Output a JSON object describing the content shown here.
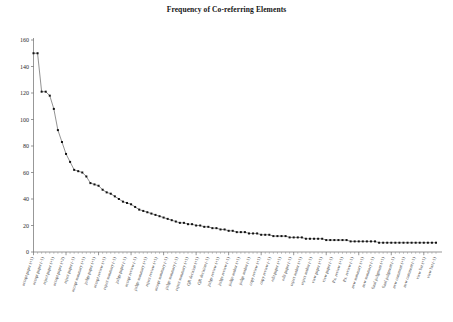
{
  "figure": {
    "title": "Frequency of Co-referring Elements",
    "background_color": "#ffffff",
    "line_color": "#565656",
    "marker_color": "#111111",
    "axis_color": "#6b6b6b"
  },
  "chart_data": {
    "type": "line",
    "title": "Frequency of Co-referring Elements",
    "xlabel": "",
    "ylabel": "",
    "ylim": [
      0,
      160
    ],
    "yticks": [
      0,
      20,
      40,
      60,
      80,
      100,
      120,
      140,
      160
    ],
    "grid": false,
    "legend": null,
    "markers": "filled-square",
    "categories": [
      "accept paper (+1)",
      "accept paper (-1)",
      "reject paper (+1)",
      "accept paper (+2)",
      "reject paper (-1)",
      "accept summary (+1)",
      "judge paper (+1)",
      "accept review (+1)",
      "reject summary (-1)",
      "judge paper (-1)",
      "accept review (-1)",
      "judge summary (+1)",
      "reject review (+1)",
      "accept summary (-1)",
      "judge summary (-1)",
      "reject summary (+1)",
      "QR decision (+1)",
      "QR decision (-1)",
      "judge review (+1)",
      "judge review (-1)",
      "judge author (+1)",
      "judge author (-1)",
      "copy review (+1)",
      "copy review (-1)",
      "edit paper (+1)",
      "edit paper (-1)",
      "reject author (+1)",
      "reject author (-1)",
      "view paper (+1)",
      "view paper (-1)",
      "P.s. review (+1)",
      "P.s. review (-1)",
      "new summary (+1)",
      "new summary (-1)",
      "final judgment (+1)",
      "final judgment (-1)",
      "new comment (+1)",
      "new comment (-1)",
      "view list (+1)",
      "view list (-1)"
    ],
    "values": [
      150,
      150,
      121,
      121,
      118,
      92,
      74,
      62,
      60,
      52,
      50,
      45,
      42,
      38,
      36,
      32,
      30,
      28,
      25,
      23,
      21,
      20,
      18,
      17,
      16,
      15,
      14,
      13,
      12,
      11,
      10,
      10,
      9,
      9,
      8,
      8,
      7,
      7,
      7,
      7
    ],
    "series_point_count": 100,
    "series_values": [
      150,
      150,
      121,
      121,
      118,
      108,
      92,
      83,
      74,
      68,
      62,
      61,
      60,
      57,
      52,
      51,
      50,
      47,
      45,
      44,
      42,
      40,
      38,
      37,
      36,
      34,
      32,
      31,
      30,
      29,
      28,
      27,
      26,
      25,
      24,
      23,
      22,
      22,
      21,
      21,
      20,
      20,
      19,
      19,
      18,
      18,
      17,
      17,
      16,
      16,
      15,
      15,
      15,
      14,
      14,
      14,
      13,
      13,
      13,
      12,
      12,
      12,
      12,
      11,
      11,
      11,
      11,
      10,
      10,
      10,
      10,
      10,
      9,
      9,
      9,
      9,
      9,
      9,
      8,
      8,
      8,
      8,
      8,
      8,
      8,
      7,
      7,
      7,
      7,
      7,
      7,
      7,
      7,
      7,
      7,
      7,
      7,
      7,
      7,
      7
    ]
  }
}
